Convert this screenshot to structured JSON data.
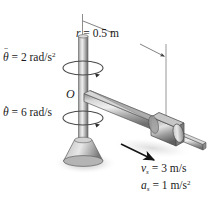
{
  "figure": {
    "background_color": "#ffffff",
    "metal_color": "#9a9a9a",
    "outline_color": "#3c3c3c"
  },
  "labels": {
    "angular_acceleration": {
      "symbol": "θ",
      "dots": "¨",
      "equals": "=",
      "value": "2",
      "unit": "rad/s",
      "exponent": "2",
      "full": "θ̈ = 2 rad/s²"
    },
    "angular_velocity": {
      "symbol": "θ",
      "dots": "·",
      "equals": "=",
      "value": "6",
      "unit": "rad/s",
      "exponent": "",
      "full": "θ̇ = 6 rad/s"
    },
    "radius": {
      "symbol": "r",
      "equals": "=",
      "value": "0.5",
      "unit": "m",
      "full": "r = 0.5 m"
    },
    "origin": {
      "symbol": "O"
    },
    "slider_velocity": {
      "symbol": "v",
      "subscript": "s",
      "equals": "=",
      "value": "3",
      "unit": "m/s",
      "exponent": "",
      "full": "vₛ = 3 m/s"
    },
    "slider_acceleration": {
      "symbol": "a",
      "subscript": "s",
      "equals": "=",
      "value": "1",
      "unit": "m/s",
      "exponent": "2",
      "full": "aₛ = 1 m/s²"
    }
  },
  "annotations": {
    "rotation_arrow_upper": "rotation-ellipse-upper",
    "rotation_arrow_lower": "rotation-ellipse-lower",
    "dimension_line": "r-dimension-line",
    "velocity_arrow": "slider-motion-arrow"
  },
  "parts": {
    "vertical_shaft": "vertical-shaft",
    "base": "conical-base",
    "horizontal_arm": "horizontal-arm",
    "collar": "sliding-collar",
    "shadow": "ground-shadow"
  }
}
